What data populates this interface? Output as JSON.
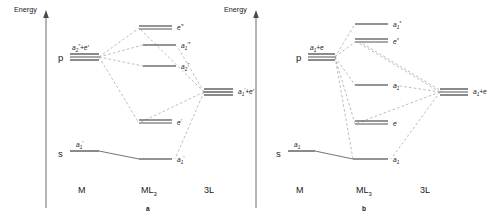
{
  "figure": {
    "axis_label": "Energy",
    "panels": [
      {
        "id": "a",
        "caption": "a",
        "columns": {
          "left": "M",
          "middle": "ML",
          "middle_sub": "3",
          "right": "3L"
        },
        "metal_levels": [
          {
            "name": "p",
            "label": "a₂″+e′",
            "label_base": "a",
            "label_sub": "2",
            "label_sup": "″",
            "label_tail": "+e′"
          },
          {
            "name": "s",
            "label": "a₁′",
            "label_base": "a",
            "label_sub": "1",
            "label_sup": "′",
            "label_tail": ""
          }
        ],
        "ml3_levels": [
          {
            "label": "e′*",
            "base": "e",
            "sub": "",
            "sup": "′*",
            "degenerate": true
          },
          {
            "label": "a₁′*",
            "base": "a",
            "sub": "1",
            "sup": "′*",
            "degenerate": false
          },
          {
            "label": "a₂″",
            "base": "a",
            "sub": "2",
            "sup": "″",
            "degenerate": false
          },
          {
            "label": "e′",
            "base": "e",
            "sub": "",
            "sup": "′",
            "degenerate": true
          },
          {
            "label": "a₁′",
            "base": "a",
            "sub": "1",
            "sup": "′",
            "degenerate": false
          }
        ],
        "ligand_level": {
          "label": "a₁′+e′",
          "base": "a",
          "sub": "1",
          "sup": "′",
          "tail": "+e′"
        }
      },
      {
        "id": "b",
        "caption": "b",
        "columns": {
          "left": "M",
          "middle": "ML",
          "middle_sub": "3",
          "right": "3L"
        },
        "metal_levels": [
          {
            "name": "p",
            "label": "a₁+e",
            "label_base": "a",
            "label_sub": "1",
            "label_sup": "",
            "label_tail": "+e"
          },
          {
            "name": "s",
            "label": "a₁",
            "label_base": "a",
            "label_sub": "1",
            "label_sup": "",
            "label_tail": ""
          }
        ],
        "ml3_levels": [
          {
            "label": "a₁*",
            "base": "a",
            "sub": "1",
            "sup": "*",
            "degenerate": false
          },
          {
            "label": "e*",
            "base": "e",
            "sub": "",
            "sup": "*",
            "degenerate": true
          },
          {
            "label": "a₁",
            "base": "a",
            "sub": "1",
            "sup": "",
            "degenerate": false
          },
          {
            "label": "e",
            "base": "e",
            "sub": "",
            "sup": "",
            "degenerate": true
          },
          {
            "label": "a₁",
            "base": "a",
            "sub": "1",
            "sup": "",
            "degenerate": false
          }
        ],
        "ligand_level": {
          "label": "a₁+e",
          "base": "a",
          "sub": "1",
          "sup": "",
          "tail": "+e"
        }
      }
    ]
  }
}
